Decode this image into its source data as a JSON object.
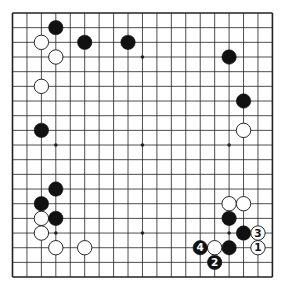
{
  "board": {
    "size": 19,
    "origin_x": 12.5,
    "origin_y": 13,
    "step_x": 14.44,
    "step_y": 14.67,
    "stone_radius": 7.2,
    "colors": {
      "line": "#222222",
      "black": "#111111",
      "white": "#ffffff",
      "background": "#ffffff"
    },
    "star_points": [
      [
        3,
        3
      ],
      [
        9,
        3
      ],
      [
        15,
        3
      ],
      [
        3,
        9
      ],
      [
        9,
        9
      ],
      [
        15,
        9
      ],
      [
        3,
        15
      ],
      [
        9,
        15
      ],
      [
        15,
        15
      ]
    ]
  },
  "stones": [
    {
      "color": "black",
      "col": 3,
      "row": 1
    },
    {
      "color": "white",
      "col": 2,
      "row": 2
    },
    {
      "color": "black",
      "col": 5,
      "row": 2
    },
    {
      "color": "black",
      "col": 8,
      "row": 2
    },
    {
      "color": "white",
      "col": 3,
      "row": 3
    },
    {
      "color": "white",
      "col": 2,
      "row": 5
    },
    {
      "color": "black",
      "col": 2,
      "row": 8
    },
    {
      "color": "black",
      "col": 15,
      "row": 3
    },
    {
      "color": "black",
      "col": 16,
      "row": 6
    },
    {
      "color": "white",
      "col": 16,
      "row": 8
    },
    {
      "color": "black",
      "col": 3,
      "row": 12
    },
    {
      "color": "black",
      "col": 2,
      "row": 13
    },
    {
      "color": "white",
      "col": 2,
      "row": 14
    },
    {
      "color": "black",
      "col": 3,
      "row": 14
    },
    {
      "color": "white",
      "col": 2,
      "row": 15
    },
    {
      "color": "white",
      "col": 3,
      "row": 16
    },
    {
      "color": "white",
      "col": 5,
      "row": 16
    },
    {
      "color": "white",
      "col": 15,
      "row": 13
    },
    {
      "color": "white",
      "col": 16,
      "row": 13
    },
    {
      "color": "black",
      "col": 15,
      "row": 14
    },
    {
      "color": "black",
      "col": 16,
      "row": 15
    },
    {
      "color": "black",
      "col": 15,
      "row": 16
    },
    {
      "color": "white",
      "col": 14,
      "row": 16
    },
    {
      "color": "white",
      "col": 17,
      "row": 16,
      "label": "1"
    },
    {
      "color": "black",
      "col": 14,
      "row": 17,
      "label": "2"
    },
    {
      "color": "white",
      "col": 17,
      "row": 15,
      "label": "3"
    },
    {
      "color": "black",
      "col": 13,
      "row": 16,
      "label": "4"
    }
  ]
}
